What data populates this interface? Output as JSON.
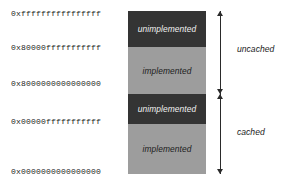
{
  "figure": {
    "kind": "memory-address-space-diagram",
    "colors": {
      "background": "#ffffff",
      "unimplemented_block": "#343434",
      "implemented_block": "#9d9d9d",
      "unimplemented_text": "#f2f2f2",
      "implemented_text": "#202020",
      "arrow": "#2a2a2a",
      "address_text": "#1c1c1c"
    }
  },
  "address_labels": [
    {
      "id": "addr-top",
      "text": "0xffffffffffffffff"
    },
    {
      "id": "addr-uncached-imp",
      "text": "0x80000fffffffffff"
    },
    {
      "id": "addr-mid",
      "text": "0x8000000000000000"
    },
    {
      "id": "addr-cached-imp",
      "text": "0x00000fffffffffff"
    },
    {
      "id": "addr-bottom",
      "text": "0x0000000000000000"
    }
  ],
  "blocks": [
    {
      "id": "uncached-unimplemented",
      "label": "unimplemented",
      "style": "dark"
    },
    {
      "id": "uncached-implemented",
      "label": "implemented",
      "style": "light"
    },
    {
      "id": "cached-unimplemented",
      "label": "unimplemented",
      "style": "dark"
    },
    {
      "id": "cached-implemented",
      "label": "implemented",
      "style": "light"
    }
  ],
  "ranges": [
    {
      "id": "range-uncached",
      "label": "uncached"
    },
    {
      "id": "range-cached",
      "label": "cached"
    }
  ]
}
